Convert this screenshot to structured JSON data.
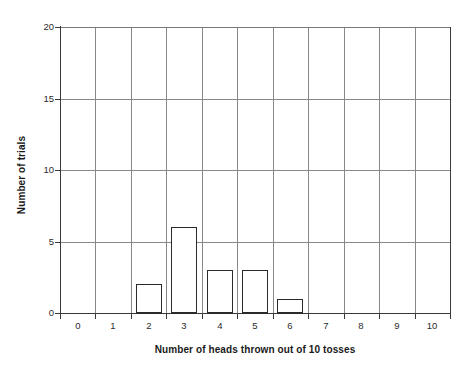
{
  "chart_data": {
    "type": "bar",
    "title": "",
    "subtitle": "",
    "xlabel": "Number of heads thrown out of 10 tosses",
    "ylabel": "Number of trials",
    "categories": [
      "0",
      "1",
      "2",
      "3",
      "4",
      "5",
      "6",
      "7",
      "8",
      "9",
      "10"
    ],
    "values": [
      0,
      0,
      2,
      6,
      3,
      3,
      1,
      0,
      0,
      0,
      0
    ],
    "xlim": [
      0,
      11
    ],
    "ylim": [
      0,
      20
    ],
    "yticks": [
      0,
      5,
      10,
      15,
      20
    ],
    "ytick_labels": [
      "0",
      "5",
      "10",
      "15",
      "20"
    ],
    "xtick_labels": [
      "0",
      "1",
      "2",
      "3",
      "4",
      "5",
      "6",
      "7",
      "8",
      "9",
      "10"
    ],
    "grid": "vertical gridlines at every category boundary; horizontal gridlines at every y tick",
    "legend": "none",
    "bar_fill": "#ffffff",
    "bar_edge": "#2b2b2b",
    "grid_color": "#888888",
    "axis_color": "#3a3a3a",
    "background": "#ffffff"
  }
}
